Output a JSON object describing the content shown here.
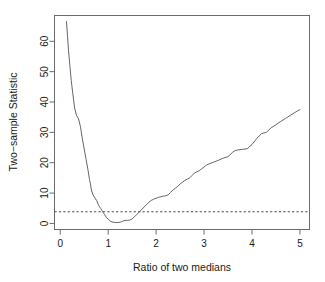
{
  "chart_data": {
    "type": "line",
    "title": "",
    "subtitle": "",
    "xlabel": "Ratio of two medians",
    "ylabel": "Two−sample Statistic",
    "xlim": [
      -0.12,
      5.2
    ],
    "ylim": [
      -2.0,
      68.5
    ],
    "xticks": [
      0,
      1,
      2,
      3,
      4,
      5
    ],
    "xtick_labels": [
      "0",
      "1",
      "2",
      "3",
      "4",
      "5"
    ],
    "yticks": [
      0,
      10,
      20,
      30,
      40,
      50,
      60
    ],
    "ytick_labels": [
      "0",
      "10",
      "20",
      "30",
      "40",
      "50",
      "60"
    ],
    "grid": false,
    "legend": null,
    "box": true,
    "series": [
      {
        "name": "Two-sample statistic curve",
        "style": "solid",
        "color": "#555555",
        "width": 0.9,
        "x": [
          0.13,
          0.15,
          0.17,
          0.2,
          0.23,
          0.26,
          0.3,
          0.34,
          0.38,
          0.42,
          0.46,
          0.5,
          0.54,
          0.58,
          0.61,
          0.63,
          0.65,
          0.68,
          0.72,
          0.76,
          0.8,
          0.84,
          0.88,
          0.92,
          0.96,
          1.0,
          1.05,
          1.1,
          1.15,
          1.2,
          1.25,
          1.3,
          1.35,
          1.4,
          1.45,
          1.5,
          1.55,
          1.6,
          1.65,
          1.7,
          1.75,
          1.8,
          1.85,
          1.9,
          1.95,
          2.0,
          2.05,
          2.1,
          2.15,
          2.2,
          2.25,
          2.3,
          2.35,
          2.4,
          2.45,
          2.5,
          2.55,
          2.6,
          2.65,
          2.7,
          2.75,
          2.8,
          2.85,
          2.9,
          2.95,
          3.0,
          3.05,
          3.1,
          3.2,
          3.3,
          3.4,
          3.5,
          3.6,
          3.65,
          3.7,
          3.8,
          3.9,
          4.0,
          4.1,
          4.2,
          4.3,
          4.4,
          4.5,
          4.6,
          4.7,
          4.8,
          4.9,
          5.0
        ],
        "y": [
          66.5,
          62.0,
          57.5,
          52.0,
          47.0,
          43.0,
          38.0,
          35.5,
          34.5,
          32.0,
          28.0,
          24.5,
          21.0,
          17.5,
          14.5,
          13.0,
          11.0,
          9.5,
          8.5,
          7.5,
          6.0,
          5.0,
          4.0,
          3.0,
          2.0,
          1.4,
          0.7,
          0.4,
          0.3,
          0.3,
          0.4,
          0.7,
          1.0,
          1.0,
          1.1,
          1.5,
          2.2,
          3.0,
          3.8,
          4.6,
          5.4,
          6.2,
          7.0,
          7.6,
          8.0,
          8.3,
          8.6,
          8.8,
          9.0,
          9.1,
          9.4,
          10.2,
          11.0,
          11.6,
          12.2,
          13.0,
          13.6,
          14.2,
          14.6,
          15.0,
          15.8,
          16.6,
          17.0,
          17.4,
          18.0,
          18.6,
          19.2,
          19.6,
          20.2,
          20.8,
          21.5,
          22.0,
          23.5,
          24.0,
          24.2,
          24.4,
          24.6,
          26.0,
          28.0,
          29.6,
          30.0,
          31.5,
          32.5,
          33.6,
          34.6,
          35.6,
          36.6,
          37.5
        ]
      }
    ],
    "reference_lines": [
      {
        "name": "critical-value-line",
        "orientation": "horizontal",
        "value": 3.84,
        "style": "dashed",
        "color": "#333333",
        "width": 0.8
      }
    ]
  }
}
